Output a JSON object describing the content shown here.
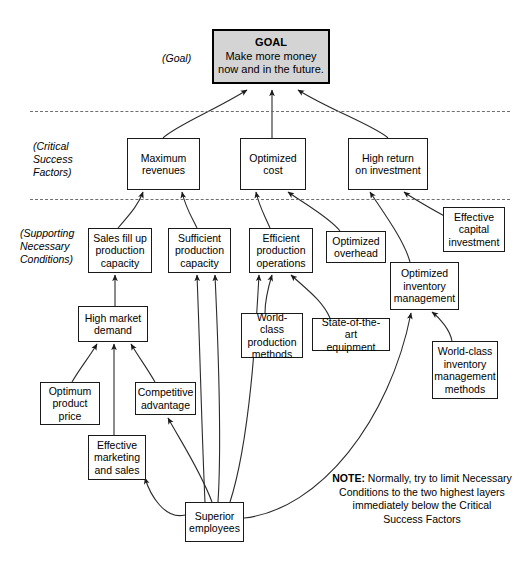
{
  "diagram": {
    "layer_labels": [
      {
        "id": "goal-label",
        "text": "(Goal)",
        "x": 162,
        "y": 52,
        "width": 60
      },
      {
        "id": "csf-label",
        "text": "(Critical\nSuccess\nFactors)",
        "x": 33,
        "y": 140,
        "width": 80
      },
      {
        "id": "snc-label",
        "text": "(Supporting\nNecessary\nConditions)",
        "x": 20,
        "y": 227,
        "width": 90
      }
    ],
    "dividers": [
      {
        "id": "divider-goal-csf",
        "x": 30,
        "y": 111,
        "width": 480
      },
      {
        "id": "divider-csf-snc",
        "x": 30,
        "y": 199,
        "width": 480
      }
    ],
    "nodes": [
      {
        "id": "goal",
        "kind": "goal",
        "title": "GOAL",
        "line1": "Make more money",
        "line2": "now and in the future.",
        "x": 212,
        "y": 29,
        "w": 118,
        "h": 55
      },
      {
        "id": "maximum-revenues",
        "label": "Maximum\nrevenues",
        "x": 127,
        "y": 138,
        "w": 73,
        "h": 52
      },
      {
        "id": "optimized-cost",
        "label": "Optimized\ncost",
        "x": 240,
        "y": 138,
        "w": 66,
        "h": 52
      },
      {
        "id": "high-return-on-investment",
        "label": "High return\non investment",
        "x": 348,
        "y": 138,
        "w": 80,
        "h": 52
      },
      {
        "id": "sales-fill-up-production-capacity",
        "label": "Sales fill up\nproduction\ncapacity",
        "x": 88,
        "y": 228,
        "w": 64,
        "h": 45
      },
      {
        "id": "sufficient-production-capacity",
        "label": "Sufficient\nproduction\ncapacity",
        "x": 168,
        "y": 228,
        "w": 63,
        "h": 45
      },
      {
        "id": "efficient-production-operations",
        "label": "Efficient\nproduction\noperations",
        "x": 249,
        "y": 228,
        "w": 64,
        "h": 45
      },
      {
        "id": "optimized-overhead",
        "label": "Optimized\noverhead",
        "x": 326,
        "y": 231,
        "w": 60,
        "h": 32
      },
      {
        "id": "effective-capital-investment",
        "label": "Effective\ncapital\ninvestment",
        "x": 443,
        "y": 207,
        "w": 62,
        "h": 45
      },
      {
        "id": "optimized-inventory-management",
        "label": "Optimized\ninventory\nmanagement",
        "x": 390,
        "y": 262,
        "w": 69,
        "h": 48
      },
      {
        "id": "high-market-demand",
        "label": "High market\ndemand",
        "x": 78,
        "y": 306,
        "w": 70,
        "h": 36
      },
      {
        "id": "world-class-production-methods",
        "label": "World-class\nproduction\nmethods",
        "x": 241,
        "y": 313,
        "w": 62,
        "h": 45
      },
      {
        "id": "state-of-the-art-equipment",
        "label": "State-of-the-art\nequipment",
        "x": 312,
        "y": 318,
        "w": 78,
        "h": 33
      },
      {
        "id": "world-class-inventory-management-methods",
        "label": "World-class\ninventory\nmanagement\nmethods",
        "x": 432,
        "y": 341,
        "w": 66,
        "h": 58
      },
      {
        "id": "optimum-product-price",
        "label": "Optimum\nproduct\nprice",
        "x": 40,
        "y": 382,
        "w": 60,
        "h": 43
      },
      {
        "id": "competitive-advantage",
        "label": "Competitive\nadvantage",
        "x": 135,
        "y": 382,
        "w": 61,
        "h": 33
      },
      {
        "id": "effective-marketing-and-sales",
        "label": "Effective\nmarketing\nand sales",
        "x": 88,
        "y": 435,
        "w": 58,
        "h": 45
      },
      {
        "id": "superior-employees",
        "label": "Superior\nemployees",
        "x": 185,
        "y": 502,
        "w": 59,
        "h": 40
      }
    ],
    "note": {
      "lead": "NOTE:",
      "text": " Normally, try to limit Necessary Conditions to the two highest layers immediately below the Critical Success Factors",
      "x": 332,
      "y": 472,
      "width": 180
    },
    "edges": [
      {
        "id": "e-maxrev-goal",
        "d": "M 163 138 C 175 126 215 110 247 90"
      },
      {
        "id": "e-optcost-goal",
        "d": "M 272 138 L 272 90"
      },
      {
        "id": "e-highret-goal",
        "d": "M 388 138 C 375 126 330 110 298 90"
      },
      {
        "id": "e-salesfill-maxrev",
        "d": "M 118 228 C 128 216 138 206 143 192"
      },
      {
        "id": "e-sufficient-maxrev",
        "d": "M 197 228 C 190 214 185 206 182 192"
      },
      {
        "id": "e-efficient-optcost",
        "d": "M 270 228 C 264 214 259 206 256 192"
      },
      {
        "id": "e-optoverhead-optcost",
        "d": "M 340 231 C 330 218 305 204 288 192"
      },
      {
        "id": "e-optinv-highret",
        "d": "M 410 262 C 404 240 383 212 370 192"
      },
      {
        "id": "e-effcap-highret",
        "d": "M 446 217 C 430 208 412 198 404 192"
      },
      {
        "id": "e-highmkt-salesfill",
        "d": "M 115 306 L 115 275"
      },
      {
        "id": "e-optprice-highmkt",
        "d": "M 72 382 C 80 368 90 356 97 344"
      },
      {
        "id": "e-compadv-highmkt",
        "d": "M 155 382 C 147 368 138 356 131 344"
      },
      {
        "id": "e-effmkt-highmkt",
        "d": "M 114 435 L 114 344"
      },
      {
        "id": "e-wcprod-efficient",
        "d": "M 265 313 C 265 300 268 288 272 275"
      },
      {
        "id": "e-soaequip-efficient",
        "d": "M 330 318 C 322 300 305 288 291 275"
      },
      {
        "id": "e-wcinv-optinv",
        "d": "M 452 341 C 450 330 440 318 432 312"
      },
      {
        "id": "e-supemp-sufficient",
        "d": "M 205 502 C 202 440 200 350 197 275"
      },
      {
        "id": "e-supemp-sufficient2",
        "d": "M 218 502 C 222 440 218 340 215 275"
      },
      {
        "id": "e-supemp-efficient",
        "d": "M 230 502 C 250 440 256 330 259 275"
      },
      {
        "id": "e-supemp-optinv",
        "d": "M 244 518 C 320 510 390 420 411 313"
      },
      {
        "id": "e-supemp-compadv",
        "d": "M 212 502 C 200 470 180 440 168 418"
      },
      {
        "id": "e-supemp-effmkt",
        "d": "M 185 515 C 165 520 150 495 145 478"
      }
    ],
    "colors": {
      "goal_fill": "#d4d4d4",
      "node_stroke": "#1a1a1a",
      "divider": "#6f6f6f",
      "edge": "#2b2b2b"
    }
  }
}
